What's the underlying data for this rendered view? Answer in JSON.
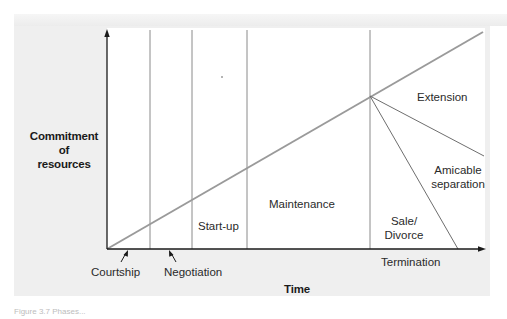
{
  "diagram": {
    "type": "phases_of_relationship",
    "y_axis_label_line1": "Commitment of",
    "y_axis_label_line2": "resources",
    "x_axis_label": "Time",
    "phases_below_axis": [
      {
        "label": "Courtship",
        "x": 120
      },
      {
        "label": "Negotiation",
        "x": 165
      }
    ],
    "phases_in_plot": [
      {
        "label": "Start-up"
      },
      {
        "label": "Maintenance"
      }
    ],
    "termination": {
      "label": "Termination",
      "outcomes": [
        {
          "label": "Extension"
        },
        {
          "label_line1": "Amicable",
          "label_line2": "separation"
        },
        {
          "label_line1": "Sale/",
          "label_line2": "Divorce"
        }
      ]
    },
    "colors": {
      "axis": "#1a1a1a",
      "phase_divider": "#8a8a8a",
      "commitment_line": "#9a9a9a",
      "branch_lines": "#6e6e6e",
      "panel_bg": "#efefef",
      "plot_bg": "#ffffff"
    }
  },
  "caption": {
    "text": "Figure 3.7  Phases..."
  }
}
